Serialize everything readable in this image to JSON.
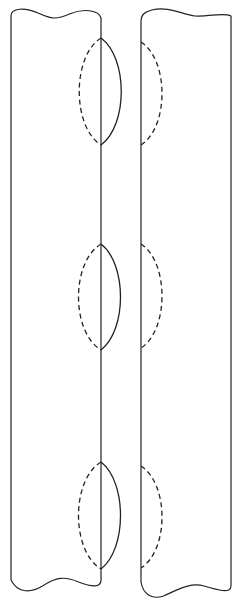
{
  "diagram": {
    "width": 237,
    "height": 611,
    "stroke_color": "#222222",
    "background": "#ffffff",
    "left_strip": {
      "left_x": 11,
      "right_x": 101,
      "top_y": 20,
      "bottom_y": 592,
      "lenses": [
        {
          "top_y": 38,
          "bottom_y": 145,
          "dashed_left_x": 80,
          "solid_right_x": 123
        },
        {
          "top_y": 244,
          "bottom_y": 350,
          "dashed_left_x": 79,
          "solid_right_x": 122
        },
        {
          "top_y": 462,
          "bottom_y": 569,
          "dashed_left_x": 79,
          "solid_right_x": 122
        }
      ]
    },
    "right_strip": {
      "left_x": 141,
      "right_x": 231,
      "top_y": 22,
      "bottom_y": 598,
      "half_ovals": [
        {
          "top_y": 42,
          "bottom_y": 145,
          "dashed_right_x": 161
        },
        {
          "top_y": 244,
          "bottom_y": 348,
          "dashed_right_x": 161
        },
        {
          "top_y": 466,
          "bottom_y": 568,
          "dashed_right_x": 161
        }
      ]
    }
  }
}
